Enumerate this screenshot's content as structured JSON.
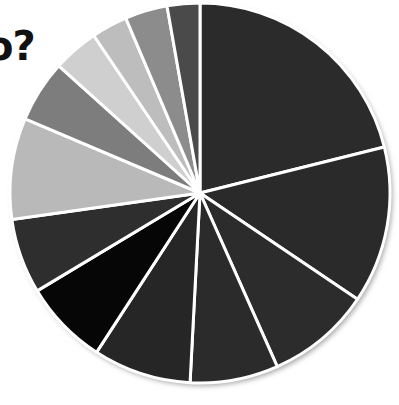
{
  "title_fragment": "o?",
  "chart_data": {
    "type": "pie",
    "title": "o?",
    "xlabel": "",
    "ylabel": "",
    "legend": "none",
    "grid": false,
    "center": {
      "x": 200,
      "y": 193
    },
    "radius": 190,
    "start_angle_deg": 0,
    "direction": "clockwise",
    "separator_color": "#ffffff",
    "separator_width_px": 3,
    "background_color": "#ffffff",
    "total": 100,
    "categories": [
      "Slice 1",
      "Slice 2",
      "Slice 3",
      "Slice 4",
      "Slice 5",
      "Slice 6",
      "Slice 7",
      "Slice 8",
      "Slice 9",
      "Slice 10",
      "Slice 11",
      "Slice 12",
      "Slice 13"
    ],
    "values": [
      21.1,
      13.3,
      8.9,
      7.5,
      8.3,
      7.2,
      6.4,
      8.6,
      5.3,
      3.9,
      3.1,
      3.6,
      2.8
    ],
    "colors": [
      "#2b2b2b",
      "#2a2a2a",
      "#2c2c2c",
      "#2b2b2b",
      "#262626",
      "#060606",
      "#2e2e2e",
      "#b9b9b9",
      "#7d7d7d",
      "#cfcfcf",
      "#bdbdbd",
      "#8c8c8c",
      "#4a4a4a"
    ],
    "slices": [
      {
        "label": "Slice 1",
        "value": 21.1,
        "color": "#2b2b2b",
        "start_deg": 0.0,
        "end_deg": 76.0
      },
      {
        "label": "Slice 2",
        "value": 13.3,
        "color": "#2a2a2a",
        "start_deg": 76.0,
        "end_deg": 124.0
      },
      {
        "label": "Slice 3",
        "value": 8.9,
        "color": "#2c2c2c",
        "start_deg": 124.0,
        "end_deg": 156.0
      },
      {
        "label": "Slice 4",
        "value": 7.5,
        "color": "#2b2b2b",
        "start_deg": 156.0,
        "end_deg": 183.0
      },
      {
        "label": "Slice 5",
        "value": 8.3,
        "color": "#262626",
        "start_deg": 183.0,
        "end_deg": 213.0
      },
      {
        "label": "Slice 6",
        "value": 7.2,
        "color": "#060606",
        "start_deg": 213.0,
        "end_deg": 239.0
      },
      {
        "label": "Slice 7",
        "value": 6.4,
        "color": "#2e2e2e",
        "start_deg": 239.0,
        "end_deg": 262.0
      },
      {
        "label": "Slice 8",
        "value": 8.6,
        "color": "#b9b9b9",
        "start_deg": 262.0,
        "end_deg": 293.0
      },
      {
        "label": "Slice 9",
        "value": 5.3,
        "color": "#7d7d7d",
        "start_deg": 293.0,
        "end_deg": 312.0
      },
      {
        "label": "Slice 10",
        "value": 3.9,
        "color": "#cfcfcf",
        "start_deg": 312.0,
        "end_deg": 326.0
      },
      {
        "label": "Slice 11",
        "value": 3.1,
        "color": "#bdbdbd",
        "start_deg": 326.0,
        "end_deg": 337.0
      },
      {
        "label": "Slice 12",
        "value": 3.6,
        "color": "#8c8c8c",
        "start_deg": 337.0,
        "end_deg": 350.0
      },
      {
        "label": "Slice 13",
        "value": 2.8,
        "color": "#4a4a4a",
        "start_deg": 350.0,
        "end_deg": 360.0
      }
    ]
  }
}
